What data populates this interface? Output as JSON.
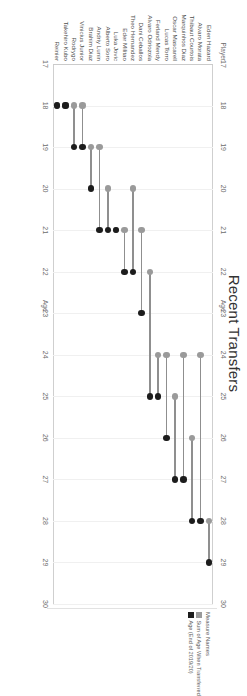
{
  "chart": {
    "title": "Recent Transfers",
    "x_axis_title": "Age",
    "category_header": "Player"
  },
  "legend": {
    "title": "Measure Names",
    "items": [
      {
        "label": "Sum of Age When Transferred",
        "color": "#9a9a9a",
        "swatch": "transferred"
      },
      {
        "label": "Age (End of 2019/20)",
        "color": "#1c1c1c",
        "swatch": "current"
      }
    ]
  },
  "chart_data": {
    "type": "bar",
    "subtype": "dumbbell",
    "title": "Recent Transfers",
    "xlabel": "Age",
    "ylabel": "Player",
    "xlim": [
      17,
      30
    ],
    "xticks": [
      17,
      18,
      19,
      20,
      21,
      22,
      23,
      24,
      25,
      26,
      27,
      28,
      29,
      30
    ],
    "grid": true,
    "legend_position": "right",
    "categories": [
      "Eden Hazard",
      "Alvaro Morata",
      "Thibaut Courtois",
      "Marquinhos Diaz",
      "Oscar Mascarell",
      "Lucas Torro",
      "Ferland Mendy",
      "Alvaro Odriozola",
      "Dani Ceballos",
      "Theo Hernandez",
      "Eder Militao",
      "Luka Jovic",
      "Alberto Soro",
      "Andriy Lunin",
      "Brahim Diaz",
      "Vinicius Junior",
      "Rodrygo",
      "Takehiro Kubo",
      "Reinier"
    ],
    "series": [
      {
        "name": "Sum of Age When Transferred",
        "color": "#9a9a9a",
        "values": [
          28,
          24,
          26,
          24,
          25,
          24,
          24,
          22,
          21,
          20,
          21,
          21,
          20,
          19,
          19,
          18,
          18,
          18,
          18
        ]
      },
      {
        "name": "Age (End of 2019/20)",
        "color": "#1c1c1c",
        "values": [
          29,
          28,
          28,
          27,
          27,
          26,
          25,
          25,
          23,
          22,
          22,
          21,
          21,
          21,
          20,
          19,
          19,
          18,
          18
        ]
      }
    ]
  }
}
